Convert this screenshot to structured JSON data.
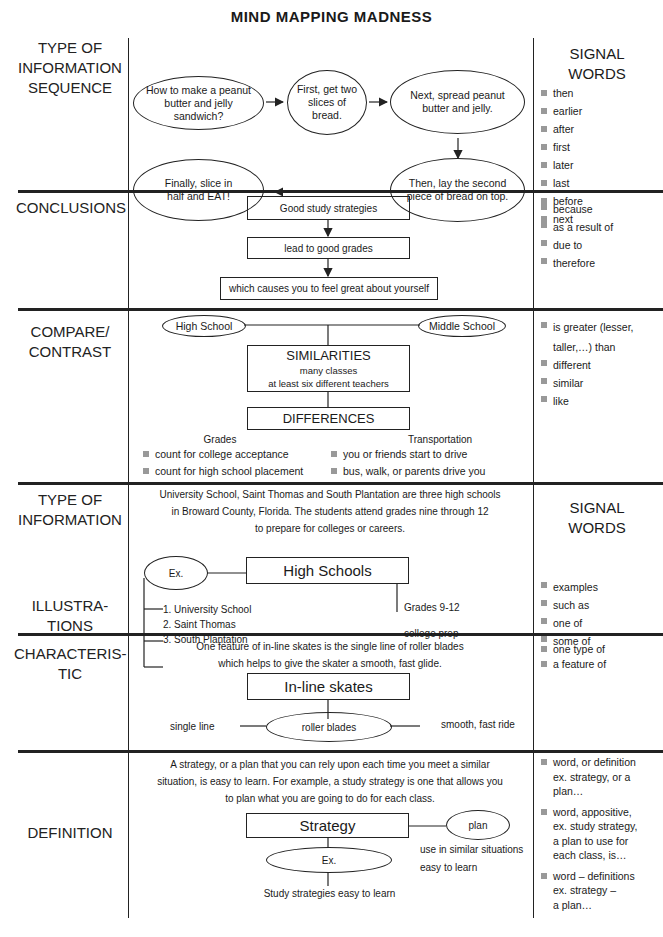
{
  "title": "MIND MAPPING MADNESS",
  "signal_header": [
    "SIGNAL",
    "WORDS"
  ],
  "sections": {
    "sequence": {
      "label": [
        "TYPE OF",
        "INFORMATION",
        "SEQUENCE"
      ],
      "nodes": [
        "How to make a peanut butter and jelly sandwich?",
        "First, get two slices of bread.",
        "Next, spread peanut butter and jelly.",
        "Then, lay the second piece of bread on top.",
        "Finally, slice in half and EAT!"
      ],
      "signal_words": [
        "then",
        "earlier",
        "after",
        "first",
        "later",
        "last",
        "before",
        "next"
      ]
    },
    "conclusions": {
      "label": "CONCLUSIONS",
      "boxes": [
        "Good study strategies",
        "lead to good grades",
        "which causes you to feel great about yourself"
      ],
      "signal_words": [
        "because",
        "as a result of",
        "due to",
        "therefore"
      ]
    },
    "compare": {
      "label": [
        "COMPARE/",
        "CONTRAST"
      ],
      "left": "High School",
      "right": "Middle School",
      "similarities_title": "SIMILARITIES",
      "similarities": [
        "many classes",
        "at least six different teachers"
      ],
      "differences_title": "DIFFERENCES",
      "grades_title": "Grades",
      "grades": [
        "count for college acceptance",
        "count for high school placement"
      ],
      "transport_title": "Transportation",
      "transport": [
        "you or friends start to drive",
        "bus, walk, or parents drive you"
      ],
      "signal_words": [
        "is greater (lesser,",
        "taller,…) than",
        "different",
        "similar",
        "like"
      ]
    },
    "illustrations": {
      "label_top": [
        "TYPE OF",
        "INFORMATION"
      ],
      "label": [
        "ILLUSTRA-",
        "TIONS"
      ],
      "paragraph": [
        "University School, Saint Thomas and South Plantation are three high schools",
        "in Broward County, Florida.  The students attend grades nine through 12",
        "to prepare for colleges or careers."
      ],
      "ex": "Ex.",
      "main": "High Schools",
      "examples": [
        "1. University School",
        "2. Saint Thomas",
        "3. South Plantation"
      ],
      "details": [
        "Grades 9-12",
        "college prep"
      ],
      "signal_words": [
        "examples",
        "such as",
        "one of",
        "some of"
      ]
    },
    "characteristic": {
      "label": [
        "CHARACTERIS-",
        "TIC"
      ],
      "paragraph": [
        "One feature of in-line skates is the single line of roller blades",
        "which helps to give the skater a smooth, fast glide."
      ],
      "main": "In-line skates",
      "center": "roller blades",
      "left": "single line",
      "right": "smooth, fast ride",
      "signal_words": [
        "one type of",
        "a feature of"
      ]
    },
    "definition": {
      "label": "DEFINITION",
      "paragraph": [
        "A strategy, or a plan that you can rely upon each time you meet a similar",
        "situation, is easy to learn. For example, a study strategy is one that allows you",
        "to plan what you are going to do for each class."
      ],
      "main": "Strategy",
      "plan": "plan",
      "ex": "Ex.",
      "details": [
        "use in similar situations",
        "easy to learn"
      ],
      "example": "Study strategies easy to learn",
      "signal_words": [
        [
          "word, or definition",
          "ex. strategy, or a",
          "plan…"
        ],
        [
          "word, appositive,",
          "ex. study strategy,",
          "a plan to use for",
          "each class, is…"
        ],
        [
          "word – definitions",
          "ex. strategy –",
          "a plan…"
        ]
      ]
    }
  }
}
